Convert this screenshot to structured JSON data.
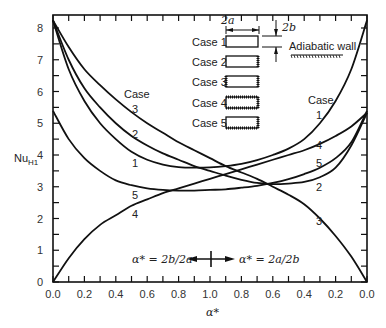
{
  "chart_data": {
    "type": "line",
    "title": "",
    "xlabel": "α*",
    "ylabel": "Nu_H1",
    "ylim": [
      0,
      8
    ],
    "yticks": [
      0,
      1,
      2,
      3,
      4,
      5,
      6,
      7,
      8
    ],
    "xticks_left": [
      "0.0",
      "0.2",
      "0.4",
      "0.6",
      "0.8",
      "1.0"
    ],
    "xticks_right": [
      "1.0",
      "0.8",
      "0.6",
      "0.4",
      "0.2",
      "0.0"
    ],
    "x_axis_note": "Left half: α* = 2b/2a from 0 to 1.0; right half: α* = 2a/2b from 1.0 back to 0",
    "x": [
      0.0,
      0.1,
      0.2,
      0.3,
      0.4,
      0.5,
      0.6,
      0.7,
      0.8,
      0.9,
      1.0,
      0.9,
      0.8,
      0.7,
      0.6,
      0.5,
      0.4,
      0.3,
      0.2,
      0.1,
      0.0
    ],
    "series": [
      {
        "name": "Case 1",
        "values": [
          8.24,
          6.7,
          5.7,
          5.0,
          4.5,
          4.1,
          3.85,
          3.7,
          3.62,
          3.6,
          3.61,
          3.65,
          3.72,
          3.84,
          4.0,
          4.2,
          4.5,
          5.0,
          5.7,
          6.7,
          8.24
        ]
      },
      {
        "name": "Case 2",
        "values": [
          8.24,
          7.0,
          6.1,
          5.5,
          5.0,
          4.6,
          4.3,
          4.05,
          3.85,
          3.65,
          3.5,
          3.35,
          3.22,
          3.12,
          3.08,
          3.1,
          3.15,
          3.3,
          3.6,
          4.3,
          5.33
        ]
      },
      {
        "name": "Case 3",
        "values": [
          8.24,
          7.4,
          6.7,
          6.2,
          5.75,
          5.35,
          5.0,
          4.7,
          4.4,
          4.15,
          3.9,
          3.65,
          3.45,
          3.25,
          3.0,
          2.75,
          2.45,
          2.0,
          1.45,
          0.8,
          0.0
        ]
      },
      {
        "name": "Case 4",
        "values": [
          0.0,
          0.75,
          1.35,
          1.8,
          2.1,
          2.4,
          2.6,
          2.8,
          2.95,
          3.1,
          3.25,
          3.4,
          3.55,
          3.7,
          3.85,
          4.0,
          4.15,
          4.35,
          4.6,
          4.9,
          5.33
        ]
      },
      {
        "name": "Case 5",
        "values": [
          5.39,
          4.5,
          3.9,
          3.5,
          3.2,
          3.05,
          2.95,
          2.9,
          2.88,
          2.88,
          2.9,
          2.92,
          2.97,
          3.03,
          3.12,
          3.24,
          3.4,
          3.6,
          3.9,
          4.4,
          5.39
        ]
      }
    ],
    "annotations": [
      "α* = 2b/2a",
      "α* = 2a/2b",
      "Case 1",
      "Case 2",
      "Case 3",
      "Case 4",
      "Case 5",
      "2a",
      "2b",
      "Adiabatic wall"
    ],
    "grid": false,
    "legend_position": "top-center (schematic rectangles)"
  },
  "labels": {
    "ylabel_main": "Nu",
    "ylabel_sub": "H1",
    "xlabel": "α*",
    "left_ratio": "α* = 2b/2a",
    "right_ratio": "α* = 2a/2b",
    "left_case_header": "Case",
    "right_case_header": "Case",
    "dim_a": "2a",
    "dim_b": "2b",
    "adiabatic": "Adiabatic wall",
    "cases": [
      "Case 1",
      "Case 2",
      "Case 3",
      "Case 4",
      "Case 5"
    ],
    "left_curve_labels": [
      "3",
      "2",
      "1",
      "5",
      "4"
    ],
    "right_curve_labels": [
      "1",
      "4",
      "5",
      "2",
      "3"
    ]
  }
}
